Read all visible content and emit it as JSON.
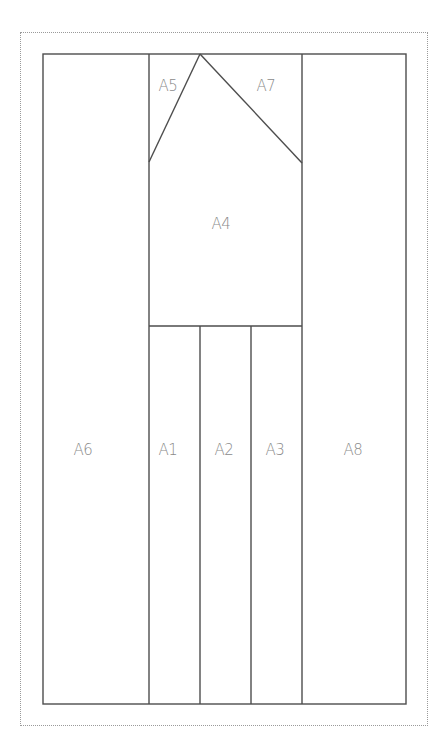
{
  "diagram": {
    "colors": {
      "line": "#4d4d4d",
      "label": "#8a8a8a",
      "border": "#9a9a9a"
    },
    "regions": [
      {
        "id": "A1",
        "label": "A1",
        "x": 168,
        "y": 450
      },
      {
        "id": "A2",
        "label": "A2",
        "x": 224,
        "y": 450
      },
      {
        "id": "A3",
        "label": "A3",
        "x": 275,
        "y": 450
      },
      {
        "id": "A4",
        "label": "A4",
        "x": 221,
        "y": 224
      },
      {
        "id": "A5",
        "label": "A5",
        "x": 168,
        "y": 86
      },
      {
        "id": "A6",
        "label": "A6",
        "x": 83,
        "y": 450
      },
      {
        "id": "A7",
        "label": "A7",
        "x": 266,
        "y": 86
      },
      {
        "id": "A8",
        "label": "A8",
        "x": 353,
        "y": 450
      }
    ]
  }
}
